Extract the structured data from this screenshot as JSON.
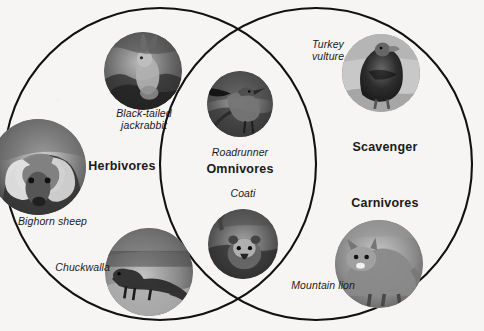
{
  "diagram": {
    "type": "venn",
    "background_color": "#f6f5f3",
    "stroke_color": "#111111",
    "sets": [
      {
        "id": "left",
        "label": "Herbivores",
        "cx": 160,
        "cy": 164,
        "r": 156
      },
      {
        "id": "right",
        "label": "Carnivores",
        "cx": 316,
        "cy": 164,
        "r": 156
      }
    ],
    "intersection_label": "Omnivores",
    "extra_label": "Scavenger"
  },
  "labels": {
    "herbivores": "Herbivores",
    "omnivores": "Omnivores",
    "carnivores": "Carnivores",
    "scavenger": "Scavenger"
  },
  "animals": [
    {
      "id": "black-tailed-jackrabbit",
      "caption": "Black-tailed\njackrabbit",
      "region": "Herbivores",
      "photo": {
        "cx": 143,
        "cy": 71,
        "r": 39
      },
      "caption_pos": {
        "x": 104,
        "y": 108,
        "w": 80,
        "align": "center"
      }
    },
    {
      "id": "bighorn-sheep",
      "caption": "Bighorn sheep",
      "region": "Herbivores",
      "photo": {
        "cx": 38,
        "cy": 167,
        "r": 48
      },
      "caption_pos": {
        "x": 18,
        "y": 216,
        "w": 88,
        "align": "left"
      }
    },
    {
      "id": "chuckwalla",
      "caption": "Chuckwalla",
      "region": "Herbivores",
      "photo": {
        "cx": 149,
        "cy": 272,
        "r": 44
      },
      "caption_pos": {
        "x": 47,
        "y": 263,
        "w": 62,
        "align": "right"
      }
    },
    {
      "id": "roadrunner",
      "caption": "Roadrunner",
      "region": "Omnivores",
      "photo": {
        "cx": 240,
        "cy": 104,
        "r": 33
      },
      "caption_pos": {
        "x": 198,
        "y": 148,
        "w": 84,
        "align": "center"
      }
    },
    {
      "id": "coati",
      "caption": "Coati",
      "region": "Omnivores",
      "photo": {
        "cx": 243,
        "cy": 244,
        "r": 35
      },
      "caption_pos": {
        "x": 213,
        "y": 189,
        "w": 60,
        "align": "center"
      }
    },
    {
      "id": "turkey-vulture",
      "caption": "Turkey\nvulture",
      "region": "Scavenger",
      "photo": {
        "cx": 381,
        "cy": 73,
        "r": 39
      },
      "caption_pos": {
        "x": 304,
        "y": 40,
        "w": 46,
        "align": "center"
      }
    },
    {
      "id": "mountain-lion",
      "caption": "Mountain lion",
      "region": "Carnivores",
      "photo": {
        "cx": 379,
        "cy": 264,
        "r": 44
      },
      "caption_pos": {
        "x": 279,
        "y": 281,
        "w": 74,
        "align": "right"
      }
    }
  ],
  "category_positions": {
    "herbivores": {
      "x": 74,
      "y": 160,
      "w": 96
    },
    "omnivores": {
      "x": 197,
      "y": 163,
      "w": 86
    },
    "scavenger": {
      "x": 340,
      "y": 141,
      "w": 90
    },
    "carnivores": {
      "x": 337,
      "y": 197,
      "w": 96
    }
  }
}
